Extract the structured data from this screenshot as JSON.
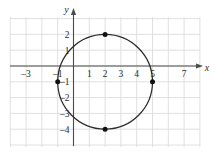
{
  "figure": {
    "title": "",
    "background_color": "#ffffff",
    "grid_color": "#dcdcdc",
    "axis_color": "#4a4a4a",
    "curve_color": "#2b2b2b",
    "point_color": "#111111",
    "label_color": "#2b2b2b",
    "x_axis_name": "x",
    "y_axis_name": "y"
  },
  "chart_data": {
    "type": "scatter",
    "title": "",
    "xlabel": "x",
    "ylabel": "y",
    "grid": true,
    "legend": null,
    "xlim": [
      -4,
      8
    ],
    "ylim": [
      -6,
      3
    ],
    "x_ticks": [
      -3,
      -1,
      1,
      2,
      3,
      4,
      5,
      7
    ],
    "x_tick_labels": [
      "-3",
      "-1",
      "1",
      "2",
      "3",
      "4",
      "5",
      "7"
    ],
    "y_ticks": [
      2,
      1,
      -1,
      -2,
      -3,
      -4
    ],
    "y_tick_labels": [
      "2",
      "1",
      "-1",
      "-2",
      "-3",
      "-4"
    ],
    "curves": [
      {
        "name": "ellipse",
        "shape": "ellipse",
        "center": [
          2,
          -1
        ],
        "semi_axis_x": 3,
        "semi_axis_y": 3,
        "equation": "(x - 2)^2 / 9 + (y + 1)^2 / 9 = 1"
      }
    ],
    "points": [
      {
        "label": "top-vertex",
        "x": 2,
        "y": 2
      },
      {
        "label": "right-vertex",
        "x": 5,
        "y": -1
      },
      {
        "label": "bottom-vertex",
        "x": 2,
        "y": -4
      },
      {
        "label": "left-vertex",
        "x": -1,
        "y": -1
      }
    ]
  },
  "geometry": {
    "origin_px": {
      "x": 73.5,
      "y": 66.0
    },
    "unit_px": 15.8,
    "grid_rect_px": {
      "left": 10,
      "top": 17,
      "right": 200,
      "bottom": 147
    },
    "grid_step_px": 15.8
  }
}
